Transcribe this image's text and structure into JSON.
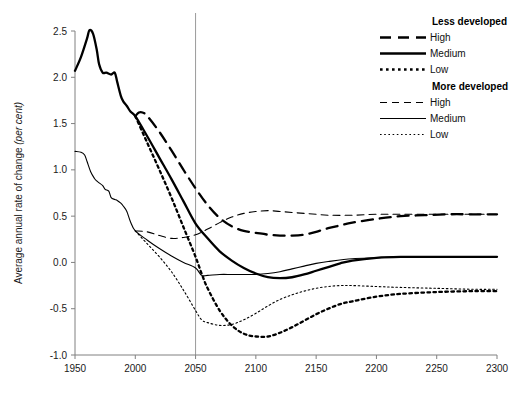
{
  "chart_data": {
    "type": "line",
    "title": "",
    "xlabel": "",
    "ylabel": "Average annual rate of change",
    "ylabel_emphasis": "(per cent)",
    "xlim": [
      1950,
      2300
    ],
    "ylim": [
      -1.0,
      2.5
    ],
    "xticks": [
      1950,
      2000,
      2050,
      2100,
      2150,
      2200,
      2250,
      2300
    ],
    "xtick_labels": [
      "1950",
      "2000",
      "2050",
      "2100",
      "2150",
      "2200",
      "2250",
      "2300"
    ],
    "yticks": [
      -1.0,
      -0.5,
      0.0,
      0.5,
      1.0,
      1.5,
      2.0,
      2.5
    ],
    "ytick_labels": [
      "-1.0",
      "-0.5",
      "0.0",
      "0.5",
      "1.0",
      "1.5",
      "2.0",
      "2.5"
    ],
    "grid": false,
    "annotations": [
      {
        "name": "projection-start-line",
        "type": "vline",
        "x": 2050
      }
    ],
    "legend": {
      "position": "top-right",
      "groups": [
        {
          "heading": "Less developed",
          "entries": [
            {
              "label": "High",
              "style": "dashed",
              "width": "thick"
            },
            {
              "label": "Medium",
              "style": "solid",
              "width": "thick"
            },
            {
              "label": "Low",
              "style": "dotted",
              "width": "thick"
            }
          ]
        },
        {
          "heading": "More developed",
          "entries": [
            {
              "label": "High",
              "style": "dashed",
              "width": "thin"
            },
            {
              "label": "Medium",
              "style": "solid",
              "width": "thin"
            },
            {
              "label": "Low",
              "style": "dotted",
              "width": "thin"
            }
          ]
        }
      ]
    },
    "series": [
      {
        "name": "Less developed - Medium (history + projection)",
        "group": "Less developed",
        "variant": "Medium",
        "style": "solid",
        "width": "thick",
        "x": [
          1950,
          1955,
          1960,
          1962,
          1965,
          1968,
          1970,
          1973,
          1976,
          1980,
          1983,
          1985,
          1988,
          1990,
          1993,
          1996,
          2000,
          2010,
          2020,
          2030,
          2040,
          2050,
          2060,
          2070,
          2080,
          2090,
          2100,
          2110,
          2120,
          2130,
          2140,
          2150,
          2160,
          2170,
          2180,
          2200,
          2220,
          2250,
          2280,
          2300
        ],
        "y": [
          2.07,
          2.22,
          2.42,
          2.51,
          2.47,
          2.3,
          2.14,
          2.05,
          2.05,
          2.03,
          2.05,
          1.95,
          1.8,
          1.74,
          1.69,
          1.63,
          1.58,
          1.36,
          1.13,
          0.9,
          0.66,
          0.42,
          0.26,
          0.12,
          0.02,
          -0.06,
          -0.12,
          -0.16,
          -0.17,
          -0.16,
          -0.13,
          -0.09,
          -0.05,
          -0.01,
          0.02,
          0.05,
          0.06,
          0.06,
          0.06,
          0.06
        ]
      },
      {
        "name": "Less developed - High",
        "group": "Less developed",
        "variant": "High",
        "style": "dashed",
        "width": "thick",
        "x": [
          2000,
          2003,
          2006,
          2010,
          2020,
          2030,
          2040,
          2050,
          2060,
          2070,
          2080,
          2090,
          2100,
          2110,
          2120,
          2130,
          2140,
          2150,
          2160,
          2170,
          2180,
          2200,
          2220,
          2240,
          2260,
          2280,
          2300
        ],
        "y": [
          1.58,
          1.62,
          1.62,
          1.58,
          1.41,
          1.21,
          1.0,
          0.8,
          0.62,
          0.48,
          0.39,
          0.34,
          0.32,
          0.3,
          0.29,
          0.29,
          0.3,
          0.33,
          0.37,
          0.4,
          0.43,
          0.47,
          0.5,
          0.51,
          0.52,
          0.52,
          0.52
        ]
      },
      {
        "name": "Less developed - Low",
        "group": "Less developed",
        "variant": "Low",
        "style": "dotted",
        "width": "thick",
        "x": [
          2000,
          2010,
          2020,
          2030,
          2040,
          2050,
          2055,
          2060,
          2070,
          2080,
          2090,
          2100,
          2110,
          2120,
          2130,
          2140,
          2150,
          2160,
          2170,
          2180,
          2200,
          2220,
          2250,
          2280,
          2300
        ],
        "y": [
          1.58,
          1.29,
          1.0,
          0.7,
          0.38,
          0.06,
          -0.12,
          -0.28,
          -0.52,
          -0.68,
          -0.77,
          -0.8,
          -0.8,
          -0.76,
          -0.7,
          -0.63,
          -0.56,
          -0.5,
          -0.45,
          -0.42,
          -0.37,
          -0.34,
          -0.32,
          -0.31,
          -0.31
        ]
      },
      {
        "name": "More developed - Medium (history + projection)",
        "group": "More developed",
        "variant": "Medium",
        "style": "solid",
        "width": "thin",
        "x": [
          1950,
          1955,
          1958,
          1960,
          1963,
          1966,
          1968,
          1970,
          1973,
          1975,
          1978,
          1980,
          1983,
          1985,
          1988,
          1990,
          1993,
          1996,
          2000,
          2010,
          2020,
          2030,
          2040,
          2050,
          2055,
          2060,
          2070,
          2080,
          2090,
          2100,
          2110,
          2120,
          2130,
          2140,
          2150,
          2160,
          2180,
          2200,
          2220,
          2250,
          2280,
          2300
        ],
        "y": [
          1.2,
          1.19,
          1.16,
          1.09,
          0.98,
          0.91,
          0.88,
          0.86,
          0.83,
          0.79,
          0.77,
          0.7,
          0.68,
          0.67,
          0.64,
          0.61,
          0.55,
          0.44,
          0.34,
          0.24,
          0.15,
          0.07,
          0.0,
          -0.06,
          -0.14,
          -0.14,
          -0.13,
          -0.13,
          -0.13,
          -0.13,
          -0.12,
          -0.1,
          -0.07,
          -0.04,
          -0.01,
          0.01,
          0.04,
          0.05,
          0.06,
          0.06,
          0.06,
          0.06
        ]
      },
      {
        "name": "More developed - High",
        "group": "More developed",
        "variant": "High",
        "style": "dashed",
        "width": "thin",
        "x": [
          2000,
          2010,
          2020,
          2030,
          2040,
          2050,
          2060,
          2070,
          2080,
          2090,
          2100,
          2110,
          2120,
          2130,
          2140,
          2150,
          2160,
          2180,
          2200,
          2220,
          2250,
          2280,
          2300
        ],
        "y": [
          0.34,
          0.33,
          0.29,
          0.26,
          0.27,
          0.3,
          0.36,
          0.43,
          0.49,
          0.53,
          0.55,
          0.56,
          0.55,
          0.54,
          0.53,
          0.52,
          0.51,
          0.51,
          0.52,
          0.52,
          0.52,
          0.52,
          0.52
        ]
      },
      {
        "name": "More developed - Low",
        "group": "More developed",
        "variant": "Low",
        "style": "dotted",
        "width": "thin",
        "x": [
          2000,
          2010,
          2020,
          2030,
          2040,
          2050,
          2055,
          2060,
          2070,
          2080,
          2090,
          2100,
          2110,
          2120,
          2130,
          2140,
          2150,
          2160,
          2170,
          2180,
          2200,
          2220,
          2250,
          2280,
          2300
        ],
        "y": [
          0.34,
          0.2,
          0.06,
          -0.1,
          -0.3,
          -0.52,
          -0.62,
          -0.65,
          -0.68,
          -0.67,
          -0.62,
          -0.55,
          -0.47,
          -0.4,
          -0.35,
          -0.31,
          -0.28,
          -0.26,
          -0.25,
          -0.25,
          -0.26,
          -0.27,
          -0.28,
          -0.29,
          -0.29
        ]
      }
    ]
  }
}
